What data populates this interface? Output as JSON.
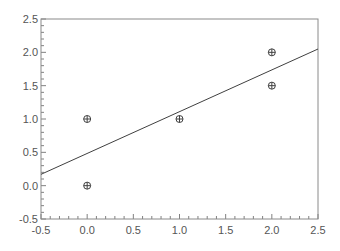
{
  "chart_data": {
    "type": "scatter",
    "title": "",
    "xlabel": "",
    "ylabel": "",
    "xlim": [
      -0.5,
      2.5
    ],
    "ylim": [
      -0.5,
      2.5
    ],
    "grid": false,
    "legend": null,
    "x_ticks": [
      "-0.5",
      "0.0",
      "0.5",
      "1.0",
      "1.5",
      "2.0",
      "2.5"
    ],
    "y_ticks": [
      "-0.5",
      "0.0",
      "0.5",
      "1.0",
      "1.5",
      "2.0",
      "2.5"
    ],
    "series": [
      {
        "name": "points",
        "type": "scatter",
        "marker": "circle-plus",
        "points": [
          [
            0,
            0
          ],
          [
            0,
            1
          ],
          [
            1,
            1
          ],
          [
            2,
            1.5
          ],
          [
            2,
            2
          ]
        ]
      },
      {
        "name": "fit-line",
        "type": "line",
        "points": [
          [
            -0.5,
            0.17
          ],
          [
            2.5,
            2.05
          ]
        ]
      }
    ]
  },
  "colors": {
    "axis": "#808080",
    "line": "#404040",
    "marker": "#404040",
    "text": "#555555"
  }
}
